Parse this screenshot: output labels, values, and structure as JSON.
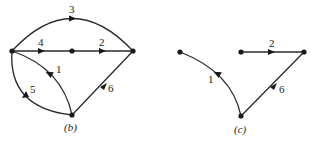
{
  "figures": [
    {
      "id": "b",
      "caption": "(b)",
      "nodes": [
        {
          "name": "left",
          "x": 12,
          "y": 51
        },
        {
          "name": "middle",
          "x": 72,
          "y": 51
        },
        {
          "name": "right",
          "x": 133,
          "y": 51
        },
        {
          "name": "bottom",
          "x": 72,
          "y": 115
        }
      ],
      "edges": [
        {
          "label": "1",
          "from": "bottom",
          "to": "left",
          "shape": "arc"
        },
        {
          "label": "2",
          "from": "middle",
          "to": "right",
          "shape": "line"
        },
        {
          "label": "3",
          "from": "left",
          "to": "right",
          "shape": "arc"
        },
        {
          "label": "4",
          "from": "left",
          "to": "middle",
          "shape": "line"
        },
        {
          "label": "5",
          "from": "bottom",
          "to": "left",
          "shape": "arc"
        },
        {
          "label": "6",
          "from": "right",
          "to": "bottom",
          "shape": "line"
        }
      ]
    },
    {
      "id": "c",
      "caption": "(c)",
      "nodes": [
        {
          "name": "left",
          "x": 180,
          "y": 52
        },
        {
          "name": "middle",
          "x": 241,
          "y": 52
        },
        {
          "name": "right",
          "x": 304,
          "y": 52
        },
        {
          "name": "bottom",
          "x": 241,
          "y": 116
        }
      ],
      "edges": [
        {
          "label": "1",
          "from": "bottom",
          "to": "left",
          "shape": "arc"
        },
        {
          "label": "2",
          "from": "middle",
          "to": "right",
          "shape": "line"
        },
        {
          "label": "6",
          "from": "right",
          "to": "bottom",
          "shape": "line"
        }
      ]
    }
  ]
}
